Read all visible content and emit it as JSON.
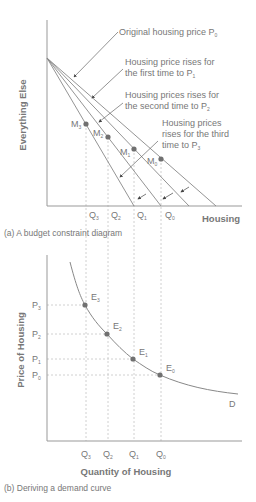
{
  "panel_a": {
    "caption": "(a) A budget constraint diagram",
    "y_axis_label": "Everything Else",
    "x_axis_label": "Housing",
    "annotations": [
      {
        "line1": "Original housing price P",
        "sub": "0"
      },
      {
        "line1": "Housing price rises for",
        "line2": "the first time to P",
        "sub": "1"
      },
      {
        "line1": "Housing prices rises for",
        "line2": "the second time to P",
        "sub": "2"
      },
      {
        "line1": "Housing prices",
        "line2": "rises for the third",
        "line3": "time to P",
        "sub": "3"
      }
    ],
    "points": [
      {
        "label": "M",
        "sub": "3"
      },
      {
        "label": "M",
        "sub": "2"
      },
      {
        "label": "M",
        "sub": "1"
      },
      {
        "label": "M",
        "sub": "0"
      }
    ],
    "x_ticks": [
      {
        "label": "Q",
        "sub": "3"
      },
      {
        "label": "Q",
        "sub": "2"
      },
      {
        "label": "Q",
        "sub": "1"
      },
      {
        "label": "Q",
        "sub": "0"
      }
    ]
  },
  "panel_b": {
    "caption": "(b) Deriving a demand curve",
    "y_axis_label": "Price of Housing",
    "x_axis_label": "Quantity of Housing",
    "curve_label": "D",
    "points": [
      {
        "label": "E",
        "sub": "3"
      },
      {
        "label": "E",
        "sub": "2"
      },
      {
        "label": "E",
        "sub": "1"
      },
      {
        "label": "E",
        "sub": "0"
      }
    ],
    "y_ticks": [
      {
        "label": "P",
        "sub": "3"
      },
      {
        "label": "P",
        "sub": "2"
      },
      {
        "label": "P",
        "sub": "1"
      },
      {
        "label": "P",
        "sub": "0"
      }
    ],
    "x_ticks": [
      {
        "label": "Q",
        "sub": "3"
      },
      {
        "label": "Q",
        "sub": "2"
      },
      {
        "label": "Q",
        "sub": "1"
      },
      {
        "label": "Q",
        "sub": "0"
      }
    ]
  },
  "colors": {
    "line": "#888888",
    "dot": "#707070",
    "text": "#777777",
    "guide": "#bbbbbb"
  }
}
